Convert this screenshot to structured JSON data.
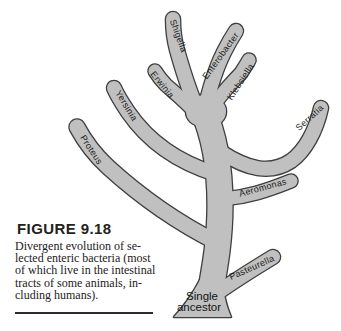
{
  "figure": {
    "caption": {
      "title": "FIGURE 9.18",
      "lines": [
        "Divergent evolution of se-",
        "lected enteric bacteria (most",
        "of which live in the intestinal",
        "tracts of some animals, in-",
        "cluding humans)."
      ]
    },
    "tree": {
      "branches": {
        "shigella": "Shigella",
        "enterobacter": "Enterobacter",
        "klebsiella": "Klebsiella",
        "erwinia": "Erwinia",
        "yersinia": "Yersinia",
        "serratia": "Serratia",
        "proteus": "Proteus",
        "aeromonas": "Aeromonas",
        "pasteurella": "Pasteurella"
      },
      "root": {
        "line1": "Single",
        "line2": "ancestor"
      }
    },
    "colors": {
      "tree_fill": "#c0c0c0",
      "tree_outline": "#3f3f3f"
    }
  }
}
